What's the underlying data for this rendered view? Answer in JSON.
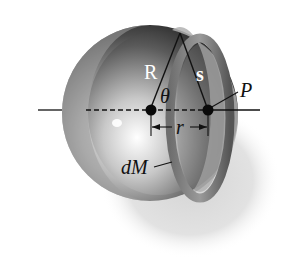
{
  "figure": {
    "labels": {
      "R": "R",
      "s": "s",
      "theta": "θ",
      "P": "P",
      "r": "r",
      "dM": "dM"
    },
    "colors": {
      "background": "#ffffff",
      "shell_dark": "#3a3a3a",
      "shell_mid": "#8a8a8a",
      "shell_light": "#d8d8d8",
      "shadow": "#cfcfcf",
      "line": "#111111"
    }
  }
}
